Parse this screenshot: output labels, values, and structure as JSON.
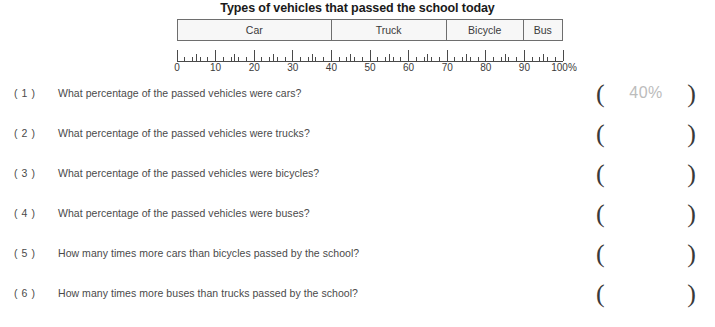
{
  "chart_data": {
    "type": "bar",
    "orientation": "horizontal-stacked",
    "title": "Types of vehicles that passed the school today",
    "xlabel": "",
    "ylabel": "",
    "xlim": [
      0,
      100
    ],
    "grid": false,
    "legend": "none",
    "categories": [
      "Car",
      "Truck",
      "Bicycle",
      "Bus"
    ],
    "values": [
      40,
      30,
      20,
      10
    ],
    "segments": [
      {
        "label": "Car",
        "start": 0,
        "end": 40,
        "value": 40
      },
      {
        "label": "Truck",
        "start": 40,
        "end": 70,
        "value": 30
      },
      {
        "label": "Bicycle",
        "start": 70,
        "end": 90,
        "value": 20
      },
      {
        "label": "Bus",
        "start": 90,
        "end": 100,
        "value": 10
      }
    ],
    "tick_labels": [
      "0",
      "10",
      "20",
      "30",
      "40",
      "50",
      "60",
      "70",
      "80",
      "90",
      "100%"
    ],
    "tick_values": [
      0,
      10,
      20,
      30,
      40,
      50,
      60,
      70,
      80,
      90,
      100
    ],
    "minor_tick_step": 2,
    "mid_tick_step": 5
  },
  "questions": [
    {
      "number": "( 1 )",
      "text": "What percentage of the passed vehicles were cars?",
      "answer": "40%"
    },
    {
      "number": "( 2 )",
      "text": "What percentage of the passed vehicles were trucks?",
      "answer": ""
    },
    {
      "number": "( 3 )",
      "text": "What percentage of the passed vehicles were bicycles?",
      "answer": ""
    },
    {
      "number": "( 4 )",
      "text": "What percentage of the passed vehicles were buses?",
      "answer": ""
    },
    {
      "number": "( 5 )",
      "text": "How many times more cars than bicycles passed by the school?",
      "answer": ""
    },
    {
      "number": "( 6 )",
      "text": "How many times more buses than trucks passed by the school?",
      "answer": ""
    }
  ],
  "answer_brackets": {
    "left": "(",
    "right": ")"
  },
  "colors": {
    "bar_fill": "#f7f7f7",
    "bar_border": "#6e6e6e",
    "text": "#4a4a4a",
    "title": "#1a1a1a",
    "answer_value": "#bcbcbc"
  }
}
